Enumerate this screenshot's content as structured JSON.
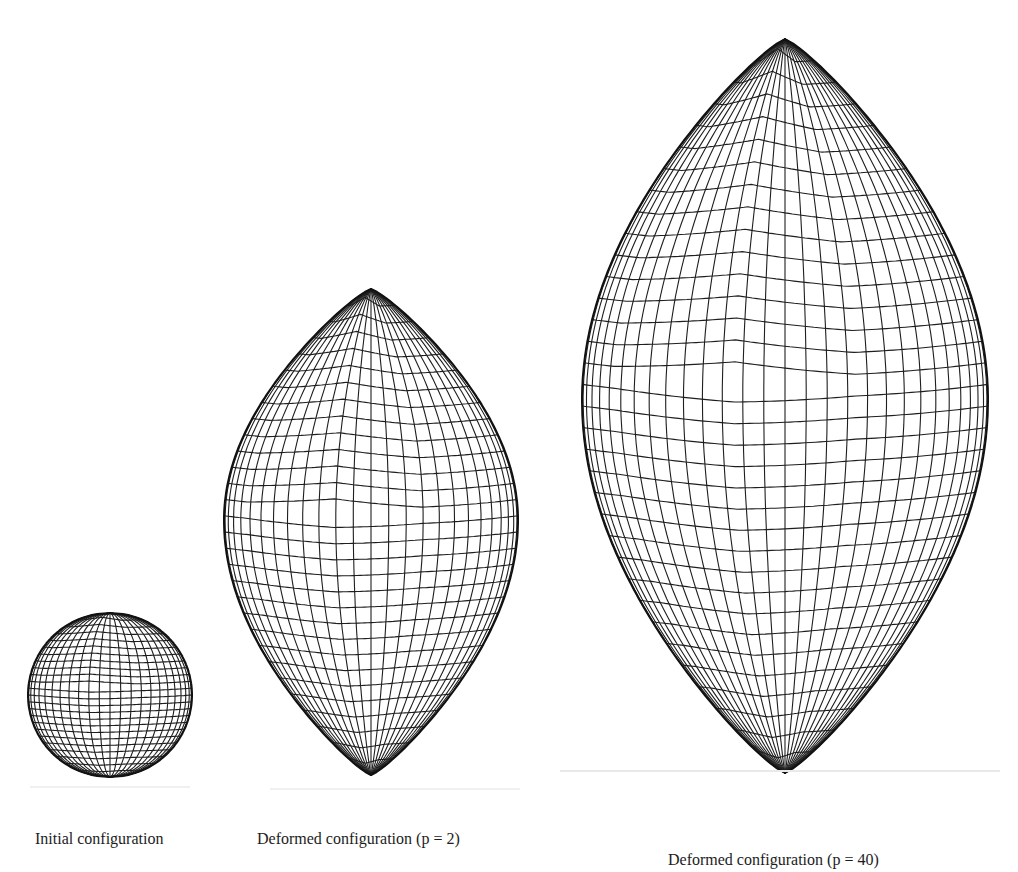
{
  "figure": {
    "panels": [
      {
        "id": "initial",
        "caption": "Initial configuration",
        "shape": "sphere",
        "cx": 110,
        "cy": 695,
        "rx": 82,
        "ry": 82,
        "top": 613,
        "bottom": 777,
        "caption_x": 35,
        "caption_y": 830,
        "lat_lines": 24,
        "lon_lines": 24
      },
      {
        "id": "deformed_p2",
        "caption": "Deformed configuration (p = 2)",
        "shape": "lemon",
        "cx": 371,
        "top": 289,
        "bottom": 775,
        "half_width": 147,
        "widest_y": 520,
        "caption_x": 257,
        "caption_y": 830,
        "lat_lines": 30,
        "lon_lines": 26
      },
      {
        "id": "deformed_p40",
        "caption": "Deformed configuration (p = 40)",
        "shape": "lemon",
        "cx": 785,
        "top": 39,
        "bottom": 773,
        "half_width": 203,
        "widest_y": 400,
        "caption_x": 668,
        "caption_y": 851,
        "lat_lines": 34,
        "lon_lines": 30
      }
    ]
  },
  "colors": {
    "mesh": "#1e1e1e",
    "outline": "#111111",
    "background": "#ffffff"
  }
}
